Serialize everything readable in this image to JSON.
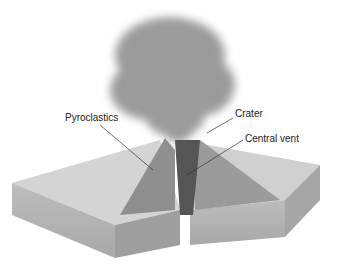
{
  "diagram": {
    "labels": {
      "pyroclastics": "Pyroclastics",
      "crater": "Crater",
      "central_vent": "Central vent"
    }
  }
}
